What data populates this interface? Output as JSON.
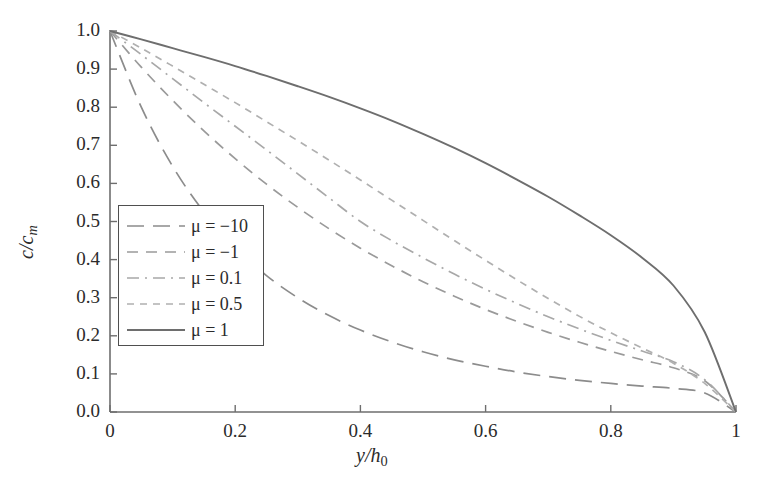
{
  "chart_data": {
    "type": "line",
    "title": "",
    "xlabel": "y/h_0",
    "ylabel": "c/c_m",
    "xlim": [
      0,
      1
    ],
    "ylim": [
      0,
      1
    ],
    "grid": false,
    "legend_position": "center-left",
    "xticks": [
      "0",
      "0.2",
      "0.4",
      "0.6",
      "0.8",
      "1"
    ],
    "xtick_values": [
      0,
      0.2,
      0.4,
      0.6,
      0.8,
      1
    ],
    "yticks": [
      "0.0",
      "0.1",
      "0.2",
      "0.3",
      "0.4",
      "0.5",
      "0.6",
      "0.7",
      "0.8",
      "0.9",
      "1.0"
    ],
    "ytick_values": [
      0,
      0.1,
      0.2,
      0.3,
      0.4,
      0.5,
      0.6,
      0.7,
      0.8,
      0.9,
      1.0
    ],
    "x": [
      0,
      0.05,
      0.1,
      0.15,
      0.2,
      0.25,
      0.3,
      0.35,
      0.4,
      0.45,
      0.5,
      0.55,
      0.6,
      0.65,
      0.7,
      0.75,
      0.8,
      0.85,
      0.9,
      0.95,
      1
    ],
    "series": [
      {
        "name": "μ = −10",
        "legend_label": "μ = −10",
        "mu": -10,
        "dash": "long-dash",
        "color": "#8c8c8c",
        "values": [
          1.0,
          0.8,
          0.645,
          0.525,
          0.432,
          0.358,
          0.3,
          0.253,
          0.215,
          0.184,
          0.158,
          0.137,
          0.12,
          0.105,
          0.093,
          0.083,
          0.075,
          0.068,
          0.062,
          0.05,
          0.0
        ]
      },
      {
        "name": "μ = −1",
        "legend_label": "μ = −1",
        "mu": -1,
        "dash": "dash",
        "color": "#9a9a9a",
        "values": [
          1.0,
          0.905,
          0.818,
          0.738,
          0.665,
          0.598,
          0.537,
          0.481,
          0.43,
          0.384,
          0.342,
          0.304,
          0.269,
          0.238,
          0.209,
          0.183,
          0.159,
          0.137,
          0.116,
          0.082,
          0.0
        ]
      },
      {
        "name": "μ = 0.1",
        "legend_label": "μ = 0.1",
        "mu": 0.1,
        "dash": "dash-dot",
        "color": "#a8a8a8",
        "values": [
          1.0,
          0.938,
          0.875,
          0.812,
          0.75,
          0.688,
          0.625,
          0.562,
          0.5,
          0.45,
          0.405,
          0.362,
          0.322,
          0.285,
          0.25,
          0.218,
          0.188,
          0.16,
          0.132,
          0.085,
          0.0
        ]
      },
      {
        "name": "μ = 0.5",
        "legend_label": "μ = 0.5",
        "mu": 0.5,
        "dash": "short-dash",
        "color": "#b0b0b0",
        "values": [
          1.0,
          0.955,
          0.908,
          0.86,
          0.812,
          0.762,
          0.712,
          0.661,
          0.609,
          0.556,
          0.503,
          0.45,
          0.398,
          0.347,
          0.298,
          0.251,
          0.208,
          0.168,
          0.128,
          0.075,
          0.0
        ]
      },
      {
        "name": "μ = 1",
        "legend_label": "μ = 1",
        "mu": 1,
        "dash": "solid",
        "color": "#6e6e6e",
        "values": [
          1.0,
          0.978,
          0.955,
          0.932,
          0.908,
          0.882,
          0.855,
          0.827,
          0.797,
          0.765,
          0.73,
          0.693,
          0.653,
          0.61,
          0.565,
          0.516,
          0.464,
          0.405,
          0.332,
          0.21,
          0.0
        ]
      }
    ]
  },
  "axes": {
    "x_title_main": "y",
    "x_title_slash": "/",
    "x_title_den": "h",
    "x_title_sub": "0",
    "y_title_num": "c",
    "y_title_slash": "/",
    "y_title_den": "c",
    "y_title_sub": "m"
  },
  "colors": {
    "axis": "#6e6e6e",
    "text": "#2b2b2b",
    "legend_border": "#4f4f4f",
    "background": "#ffffff"
  }
}
